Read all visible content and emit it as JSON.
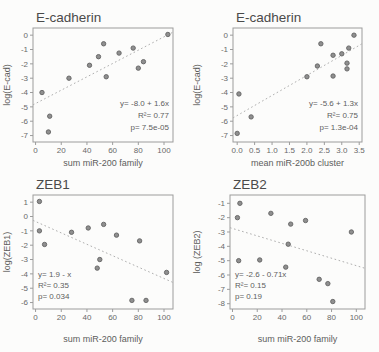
{
  "page": {
    "background": "#fcfcfb",
    "figure_name": "miR-200 family vs EMT gene scatter grid"
  },
  "colors": {
    "frame": "#9c9c9c",
    "tick_text": "#696969",
    "title_text": "#4a4a4a",
    "axis_label_text": "#5c5c5c",
    "annotation_text": "#5e5e5e",
    "point_fill": "#8f8f8f",
    "point_stroke": "#636363",
    "trend": "#aeaeae"
  },
  "chart_data": [
    {
      "type": "scatter",
      "title": "E-cadherin",
      "xlabel": "sum miR-200 family",
      "ylabel": "log(E-cad)",
      "xlim": [
        -2,
        107
      ],
      "ylim": [
        -7.45,
        0.5
      ],
      "xticks": [
        0,
        20,
        40,
        60,
        80,
        100
      ],
      "xtick_labels": [
        "0",
        "20",
        "40",
        "60",
        "80",
        "100"
      ],
      "yticks": [
        0,
        -1,
        -2,
        -3,
        -4,
        -5,
        -6,
        -7
      ],
      "ytick_labels": [
        "0",
        "-1",
        "-2",
        "-3",
        "-4",
        "-5",
        "-6",
        "-7"
      ],
      "grid": false,
      "points": [
        [
          5,
          -4.0
        ],
        [
          10,
          -6.75
        ],
        [
          11,
          -5.65
        ],
        [
          26,
          -3.0
        ],
        [
          42,
          -2.1
        ],
        [
          49,
          -1.5
        ],
        [
          53,
          -0.6
        ],
        [
          55,
          -2.9
        ],
        [
          65,
          -1.25
        ],
        [
          76,
          -0.9
        ],
        [
          80,
          -2.3
        ],
        [
          84,
          -1.85
        ],
        [
          103,
          0.05
        ]
      ],
      "trend": {
        "x1": -2,
        "y1": -4.86,
        "x2": 107,
        "y2": 0.21
      },
      "annotation": {
        "lines": [
          "y= -8.0 + 1.6x",
          "R²= 0.77",
          "p= 7.5e-05"
        ],
        "align": "right"
      },
      "layout": {
        "width": 190,
        "height": 176,
        "ml": 33,
        "mr": 17,
        "mt": 28,
        "mb": 34,
        "ann_dy": [
          36,
          24,
          12
        ]
      }
    },
    {
      "type": "scatter",
      "title": "E-cadherin",
      "xlabel": "mean miR-200b cluster",
      "ylabel": "log(E-cad)",
      "xlim": [
        -0.12,
        3.58
      ],
      "ylim": [
        -7.45,
        0.5
      ],
      "xticks": [
        0,
        0.5,
        1.0,
        1.5,
        2.0,
        2.5,
        3.0,
        3.5
      ],
      "xtick_labels": [
        "0.0",
        "0.5",
        "1.0",
        "1.5",
        "2.0",
        "2.5",
        "3.0",
        "3.5"
      ],
      "yticks": [
        0,
        -1,
        -2,
        -3,
        -4,
        -5,
        -6,
        -7
      ],
      "ytick_labels": [
        "0",
        "-1",
        "-2",
        "-3",
        "-4",
        "-5",
        "-6",
        "-7"
      ],
      "grid": false,
      "points": [
        [
          0.05,
          -4.1
        ],
        [
          0.0,
          -6.85
        ],
        [
          0.4,
          -5.7
        ],
        [
          2.0,
          -2.9
        ],
        [
          2.3,
          -2.15
        ],
        [
          2.4,
          -0.6
        ],
        [
          2.75,
          -2.85
        ],
        [
          2.75,
          -1.4
        ],
        [
          3.0,
          -1.3
        ],
        [
          3.15,
          -1.95
        ],
        [
          3.15,
          -2.35
        ],
        [
          3.2,
          -0.9
        ],
        [
          3.35,
          0.0
        ]
      ],
      "trend": {
        "x1": -0.12,
        "y1": -5.77,
        "x2": 3.58,
        "y2": -0.6
      },
      "annotation": {
        "lines": [
          "y= -5.6 + 1.3x",
          "R²= 0.75",
          "p= 1.3e-04"
        ],
        "align": "right"
      },
      "layout": {
        "width": 189,
        "height": 176,
        "ml": 43,
        "mr": 17,
        "mt": 28,
        "mb": 34,
        "ann_dy": [
          36,
          24,
          12
        ]
      }
    },
    {
      "type": "scatter",
      "title": "ZEB1",
      "xlabel": "sum miR-200 family",
      "ylabel": "log(ZEB1)",
      "xlim": [
        -2,
        107
      ],
      "ylim": [
        -6.45,
        1.5
      ],
      "xticks": [
        0,
        20,
        40,
        60,
        80,
        100
      ],
      "xtick_labels": [
        "0",
        "20",
        "40",
        "60",
        "80",
        "100"
      ],
      "yticks": [
        1,
        0,
        -1,
        -2,
        -3,
        -4,
        -5,
        -6
      ],
      "ytick_labels": [
        "1",
        "0",
        "-1",
        "-2",
        "-3",
        "-4",
        "-5",
        "-6"
      ],
      "grid": false,
      "points": [
        [
          3,
          1.05
        ],
        [
          3,
          -1.0
        ],
        [
          7,
          -1.95
        ],
        [
          28,
          -1.1
        ],
        [
          41,
          -0.8
        ],
        [
          53,
          -0.55
        ],
        [
          50,
          -3.0
        ],
        [
          48,
          -3.6
        ],
        [
          63,
          -1.3
        ],
        [
          81,
          -1.7
        ],
        [
          75,
          -5.85
        ],
        [
          86,
          -5.85
        ],
        [
          102,
          -3.9
        ]
      ],
      "trend": {
        "x1": -2,
        "y1": -0.27,
        "x2": 107,
        "y2": -4.6
      },
      "annotation": {
        "lines": [
          "y= 1.9 - x",
          "R²= 0.35",
          "p= 0.034"
        ],
        "align": "left"
      },
      "layout": {
        "width": 190,
        "height": 176,
        "ml": 33,
        "mr": 17,
        "mt": 19,
        "mb": 43,
        "ann_dy": [
          32,
          21,
          10
        ]
      }
    },
    {
      "type": "scatter",
      "title": "ZEB2",
      "xlabel": "sum miR-200 family",
      "ylabel": "log (ZEB2)",
      "xlim": [
        -2,
        107
      ],
      "ylim": [
        -8.37,
        -0.42
      ],
      "xticks": [
        0,
        20,
        40,
        60,
        80,
        100
      ],
      "xtick_labels": [
        "0",
        "20",
        "40",
        "60",
        "80",
        "100"
      ],
      "yticks": [
        -1,
        -2,
        -3,
        -4,
        -5,
        -6,
        -7,
        -8
      ],
      "ytick_labels": [
        "-1",
        "-2",
        "-3",
        "-4",
        "-5",
        "-6",
        "-7",
        "-8"
      ],
      "grid": false,
      "points": [
        [
          6,
          -1.0
        ],
        [
          4,
          -2.0
        ],
        [
          5,
          -5.0
        ],
        [
          31,
          -1.7
        ],
        [
          22,
          -4.95
        ],
        [
          47,
          -2.45
        ],
        [
          45,
          -3.85
        ],
        [
          43,
          -5.45
        ],
        [
          59,
          -2.2
        ],
        [
          70,
          -6.3
        ],
        [
          77,
          -6.6
        ],
        [
          81,
          -7.85
        ],
        [
          96,
          -3.0
        ]
      ],
      "trend": {
        "x1": -2,
        "y1": -2.7,
        "x2": 107,
        "y2": -5.53
      },
      "annotation": {
        "lines": [
          "y= -2.6 - 0.71x",
          "R²= 0.15",
          "p= 0.19"
        ],
        "align": "left"
      },
      "layout": {
        "width": 189,
        "height": 176,
        "ml": 40,
        "mr": 14,
        "mt": 19,
        "mb": 43,
        "ann_dy": [
          32,
          21,
          10
        ]
      }
    }
  ]
}
